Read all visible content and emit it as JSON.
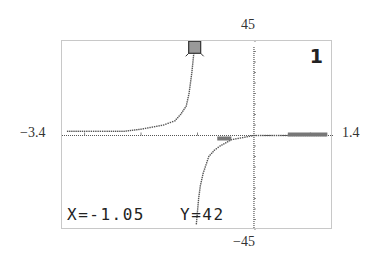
{
  "chart_data": {
    "type": "line",
    "title": "",
    "xlabel": "",
    "ylabel": "",
    "xlim": [
      -3.4,
      1.4
    ],
    "ylim": [
      -45,
      45
    ],
    "grid": false,
    "window_labels": {
      "ymax": "45",
      "ymin": "-45",
      "xmin": "-3.4",
      "xmax": "1.4"
    },
    "graph_number": "1",
    "trace": {
      "x": -1.05,
      "y": 42,
      "x_label": "X=-1.05",
      "y_label": "Y=42"
    },
    "asymptotes": {
      "vertical_x": -1.05,
      "horizontal_left_y": 2
    },
    "series": [
      {
        "name": "left-branch",
        "x": [
          -3.3,
          -3.0,
          -2.6,
          -2.3,
          -2.0,
          -1.8,
          -1.6,
          -1.4,
          -1.3,
          -1.2,
          -1.15,
          -1.1,
          -1.07,
          -1.05
        ],
        "y": [
          2,
          2,
          2,
          2,
          3,
          4,
          5,
          7,
          10,
          14,
          20,
          30,
          38,
          42
        ]
      },
      {
        "name": "right-branch",
        "x": [
          -1.02,
          -1.0,
          -0.98,
          -0.95,
          -0.9,
          -0.85,
          -0.8,
          -0.7,
          -0.6,
          -0.4,
          -0.2,
          0,
          0.6,
          1.3
        ],
        "y": [
          -42,
          -36,
          -30,
          -24,
          -18,
          -14,
          -10,
          -7,
          -5,
          -2,
          -1,
          0,
          0,
          0
        ]
      }
    ]
  },
  "labels": {
    "top": "45",
    "bottom": "−45",
    "left": "−3.4",
    "right": "1.4"
  },
  "screen": {
    "graph_id": "1",
    "x_readout": "X=-1.05",
    "y_readout": "Y=42"
  }
}
